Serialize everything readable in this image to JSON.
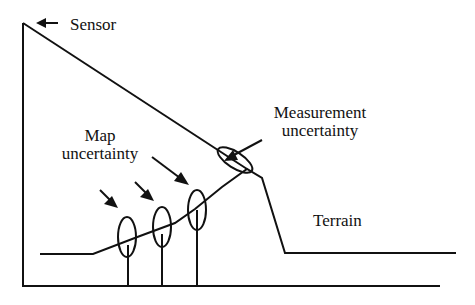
{
  "labels": {
    "sensor": "Sensor",
    "map_line1": "Map",
    "map_line2": "uncertainty",
    "meas_line1": "Measurement",
    "meas_line2": "uncertainty",
    "terrain": "Terrain"
  },
  "colors": {
    "stroke": "#111111",
    "background": "#ffffff"
  }
}
